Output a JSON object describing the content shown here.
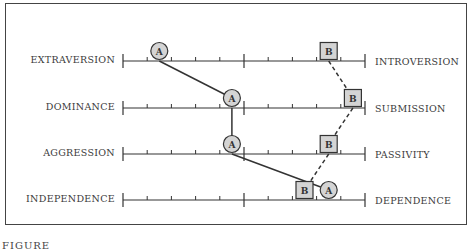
{
  "figure": {
    "caption": "FIGURE",
    "scale": {
      "min": 0,
      "max": 20,
      "major_ticks": [
        0,
        10,
        20
      ],
      "minor_step": 2
    },
    "rows": [
      {
        "left": "EXTRAVERSION",
        "right": "INTROVERSION",
        "a": 3,
        "b": 17
      },
      {
        "left": "DOMINANCE",
        "right": "SUBMISSION",
        "a": 9,
        "b": 19
      },
      {
        "left": "AGGRESSION",
        "right": "PASSIVITY",
        "a": 9,
        "b": 17
      },
      {
        "left": "INDEPENDENCE",
        "right": "DEPENDENCE",
        "a": 17,
        "b": 15
      }
    ],
    "markers": {
      "a_label": "A",
      "b_label": "B",
      "a_shape": "circle",
      "b_shape": "square"
    },
    "colors": {
      "marker_fill": "#d4d4d4",
      "line": "#333333",
      "background": "#ffffff"
    }
  },
  "chart_data": {
    "type": "profile",
    "title": "",
    "dimensions": [
      {
        "left_pole": "EXTRAVERSION",
        "right_pole": "INTROVERSION"
      },
      {
        "left_pole": "DOMINANCE",
        "right_pole": "SUBMISSION"
      },
      {
        "left_pole": "AGGRESSION",
        "right_pole": "PASSIVITY"
      },
      {
        "left_pole": "INDEPENDENCE",
        "right_pole": "DEPENDENCE"
      }
    ],
    "series": [
      {
        "name": "A",
        "marker": "circle",
        "line": "solid",
        "values": [
          3,
          9,
          9,
          17
        ]
      },
      {
        "name": "B",
        "marker": "square",
        "line": "dashed",
        "values": [
          17,
          19,
          17,
          15
        ]
      }
    ],
    "xlim": [
      0,
      20
    ],
    "ticks": "major at 0,10,20; minor every 2"
  }
}
